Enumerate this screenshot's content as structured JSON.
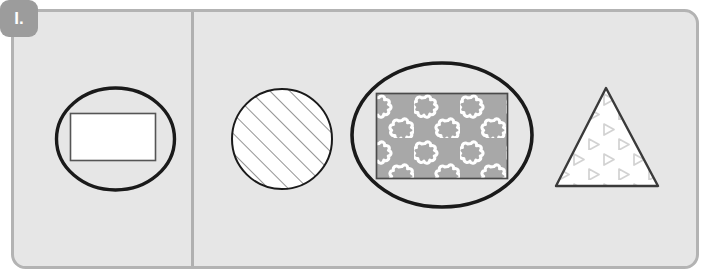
{
  "worksheet": {
    "item_label": "I.",
    "badge_color": "#9c9c9c",
    "badge_text_color": "#ffffff",
    "panel_fill": "#e6e6e6",
    "panel_border_color": "#b3b3b3",
    "divider_color": "#b0b0b0",
    "outline_color": "#1a1a1a"
  },
  "shapes": [
    {
      "id": "shape-1",
      "name": "ellipse-with-plain-rectangle",
      "outer": "ellipse",
      "inner": "rectangle",
      "inner_fill": "white",
      "inner_pattern": "none",
      "group": "left"
    },
    {
      "id": "shape-2",
      "name": "circle-with-diagonal-hatching",
      "outer": "circle",
      "inner": "none",
      "inner_fill": "white",
      "inner_pattern": "diagonal-lines",
      "group": "right"
    },
    {
      "id": "shape-3",
      "name": "ellipse-with-flower-pattern-rectangle",
      "outer": "ellipse",
      "inner": "rectangle",
      "inner_fill": "#a8a8a8",
      "inner_pattern": "flowers",
      "group": "right"
    },
    {
      "id": "shape-4",
      "name": "triangle-with-triangle-pattern",
      "outer": "triangle",
      "inner": "none",
      "inner_fill": "white",
      "inner_pattern": "small-triangles",
      "group": "right"
    }
  ],
  "patterns": {
    "hatch_color": "#7a7a7a",
    "flower_color": "#ffffff",
    "flower_bg": "#a8a8a8",
    "triangle_pattern_color": "#cfcfcf"
  }
}
